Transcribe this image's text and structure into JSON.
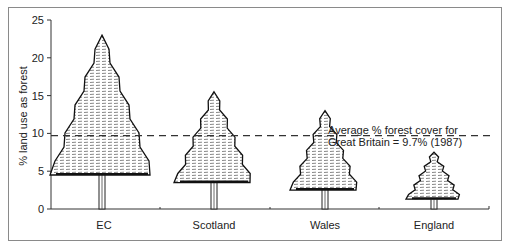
{
  "chart_data": {
    "type": "bar",
    "style": "pictogram (tree drawings; tree height = value)",
    "title": "",
    "xlabel": "",
    "ylabel": "% land use as forest",
    "ylim": [
      0,
      25
    ],
    "yticks": [
      0,
      5,
      10,
      15,
      20,
      25
    ],
    "categories": [
      "EC",
      "Scotland",
      "Wales",
      "England"
    ],
    "values": [
      23,
      15.5,
      13,
      7.5
    ],
    "reference_line": {
      "value": 9.7,
      "style": "dashed",
      "label": "Average % forest cover for Great Britain = 9.7% (1987)"
    },
    "grid": false,
    "legend": null
  },
  "axis": {
    "ylabel": "% land use as forest",
    "yticks": [
      "0",
      "5",
      "10",
      "15",
      "20",
      "25"
    ],
    "categories": [
      "EC",
      "Scotland",
      "Wales",
      "England"
    ]
  },
  "annotation": {
    "line1": "Average % forest cover for",
    "line2": "Great Britain = 9.7% (1987)"
  },
  "colors": {
    "ink": "#1a1a1a",
    "frame": "#8a8a8a",
    "background": "#ffffff"
  }
}
